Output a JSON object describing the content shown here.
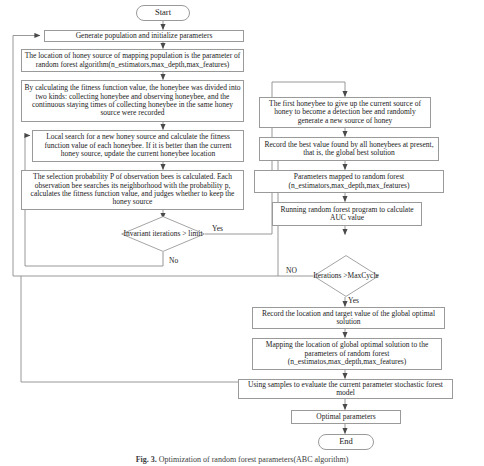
{
  "figure": {
    "caption_label": "Fig. 3.",
    "caption_text": "Optimization of random forest parameters(ABC algorithm)"
  },
  "nodes": {
    "start": {
      "label": "Start",
      "shape": "terminal"
    },
    "generate_population": {
      "label": "Generate population and initialize parameters",
      "shape": "process"
    },
    "map_location": {
      "label": "The location of honey source of mapping population is the parameter of random forest algorithm(n_estimators,max_depth,max_features)",
      "shape": "process"
    },
    "fitness_divide": {
      "label": "By calculating the fitness function value, the honeybee was divided into two kinds: collecting honeybee and observing honeybee, and the continuous staying times of collecting honeybee in the same honey source were recorded",
      "shape": "process"
    },
    "local_search": {
      "label": "Local search for a new honey source and calculate the fitness function value of each honeybee. If it is better than the current honey source, update the current honeybee location",
      "shape": "process"
    },
    "selection_probability": {
      "label": "The selection probability P of observation bees is calculated. Each observation bee searches its neighborhood with the probability p, calculates the fitness function value, and judges whether to keep the honey source",
      "shape": "process"
    },
    "invariant_decision": {
      "label": "Invariant iterations > limit",
      "shape": "decision"
    },
    "first_honeybee": {
      "label": "The first honeybee to give up the current source of honey to become a detection bee and randomly generate a new source of honey",
      "shape": "process"
    },
    "record_best": {
      "label": "Record the best value found by all honeybees at present, that is, the global best solution",
      "shape": "process"
    },
    "params_mapped": {
      "label": "Parameters mapped to random forest (n_estimators,max_depth,max_features)",
      "shape": "process"
    },
    "running_rf": {
      "label": "Running random forest program to calculate AUC value",
      "shape": "process"
    },
    "iterations_decision": {
      "label": "Iterations >MaxCycle",
      "shape": "decision"
    },
    "record_location": {
      "label": "Record the location and target value of the global optimal solution",
      "shape": "process"
    },
    "mapping_global": {
      "label": "Mapping the location of global optimal solution to the parameters of random forest (n_estimatos,max_depth,max_features)",
      "shape": "process"
    },
    "using_samples": {
      "label": "Using samples to evaluate the current parameter stochastic forest model",
      "shape": "process"
    },
    "optimal_parameters": {
      "label": "Optimal parameters",
      "shape": "process"
    },
    "end": {
      "label": "End",
      "shape": "terminal"
    }
  },
  "edge_labels": {
    "invariant_yes": "Yes",
    "invariant_no": "No",
    "iterations_no": "NO",
    "iterations_yes": "Yes"
  },
  "colors": {
    "border": "#9a9a9a",
    "line": "#7a7a7a",
    "text": "#1a1a1a",
    "background": "#ffffff"
  }
}
